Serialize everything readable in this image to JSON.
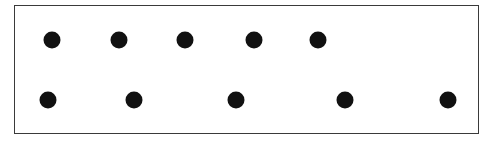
{
  "diagram": {
    "dot_color": "#111111",
    "border_color": "#3a3a3a",
    "rows": [
      {
        "name": "top-row",
        "count": 5,
        "y": 40,
        "x": [
          52,
          119,
          185,
          254,
          318
        ]
      },
      {
        "name": "bottom-row",
        "count": 5,
        "y": 100,
        "x": [
          48,
          134,
          236,
          345,
          448
        ]
      }
    ]
  }
}
